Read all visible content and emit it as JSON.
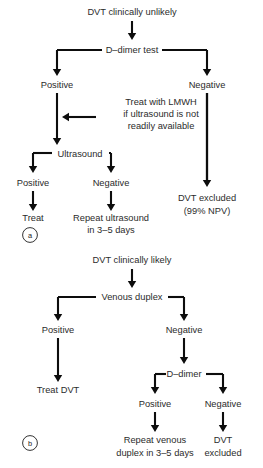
{
  "figure": {
    "width": 263,
    "height": 468,
    "background_color": "#ffffff",
    "line_color": "#0d0d0d",
    "text_color": "#2b2b2b"
  },
  "panels": [
    {
      "id": "a",
      "letter": "a",
      "cx": 30,
      "cy": 235,
      "r": 7.4,
      "title": "DVT clinically unlikely"
    },
    {
      "id": "b",
      "letter": "b",
      "cx": 30,
      "cy": 443,
      "r": 7.4,
      "title": "DVT clinically likely"
    }
  ],
  "nodes": [
    {
      "id": "a-root",
      "text": "DVT clinically unlikely",
      "x": 132,
      "y": 15,
      "anchor": "middle",
      "panel": "a"
    },
    {
      "id": "a-ddimer",
      "text": "D–dimer test",
      "x": 132,
      "y": 53,
      "anchor": "middle",
      "panel": "a"
    },
    {
      "id": "a-pos",
      "text": "Positive",
      "x": 57,
      "y": 88,
      "anchor": "middle",
      "panel": "a"
    },
    {
      "id": "a-neg",
      "text": "Negative",
      "x": 207,
      "y": 88,
      "anchor": "middle",
      "panel": "a"
    },
    {
      "id": "a-lmwh-1",
      "text": "Treat with LMWH",
      "x": 161,
      "y": 105,
      "anchor": "middle",
      "panel": "a"
    },
    {
      "id": "a-lmwh-2",
      "text": "if ultrasound is not",
      "x": 161,
      "y": 117,
      "anchor": "middle",
      "panel": "a"
    },
    {
      "id": "a-lmwh-3",
      "text": "readily available",
      "x": 161,
      "y": 129,
      "anchor": "middle",
      "panel": "a"
    },
    {
      "id": "a-us",
      "text": "Ultrasound",
      "x": 80,
      "y": 157,
      "anchor": "middle",
      "panel": "a"
    },
    {
      "id": "a-us-pos",
      "text": "Positive",
      "x": 33,
      "y": 186,
      "anchor": "middle",
      "panel": "a"
    },
    {
      "id": "a-us-neg",
      "text": "Negative",
      "x": 111,
      "y": 186,
      "anchor": "middle",
      "panel": "a"
    },
    {
      "id": "a-treat",
      "text": "Treat",
      "x": 33,
      "y": 221,
      "anchor": "middle",
      "panel": "a"
    },
    {
      "id": "a-repeat-1",
      "text": "Repeat ultrasound",
      "x": 111,
      "y": 221,
      "anchor": "middle",
      "panel": "a"
    },
    {
      "id": "a-repeat-2",
      "text": "in 3–5 days",
      "x": 111,
      "y": 233,
      "anchor": "middle",
      "panel": "a"
    },
    {
      "id": "a-excluded-1",
      "text": "DVT excluded",
      "x": 207,
      "y": 201,
      "anchor": "middle",
      "panel": "a"
    },
    {
      "id": "a-excluded-2",
      "text": "(99% NPV)",
      "x": 207,
      "y": 214,
      "anchor": "middle",
      "panel": "a"
    },
    {
      "id": "b-root",
      "text": "DVT clinically likely",
      "x": 132,
      "y": 263,
      "anchor": "middle",
      "panel": "b"
    },
    {
      "id": "b-duplex",
      "text": "Venous duplex",
      "x": 132,
      "y": 300,
      "anchor": "middle",
      "panel": "b"
    },
    {
      "id": "b-pos",
      "text": "Positive",
      "x": 58,
      "y": 333,
      "anchor": "middle",
      "panel": "b"
    },
    {
      "id": "b-neg",
      "text": "Negative",
      "x": 184,
      "y": 333,
      "anchor": "middle",
      "panel": "b"
    },
    {
      "id": "b-treat",
      "text": "Treat DVT",
      "x": 58,
      "y": 393,
      "anchor": "middle",
      "panel": "b"
    },
    {
      "id": "b-ddimer",
      "text": "D–dimer",
      "x": 184,
      "y": 377,
      "anchor": "middle",
      "panel": "b"
    },
    {
      "id": "b-dd-pos",
      "text": "Positive",
      "x": 155,
      "y": 407,
      "anchor": "middle",
      "panel": "b"
    },
    {
      "id": "b-dd-neg",
      "text": "Negative",
      "x": 223,
      "y": 407,
      "anchor": "middle",
      "panel": "b"
    },
    {
      "id": "b-repeat-1",
      "text": "Repeat venous",
      "x": 155,
      "y": 443,
      "anchor": "middle",
      "panel": "b"
    },
    {
      "id": "b-repeat-2",
      "text": "duplex in 3–5 days",
      "x": 155,
      "y": 456,
      "anchor": "middle",
      "panel": "b"
    },
    {
      "id": "b-excluded-1",
      "text": "DVT",
      "x": 223,
      "y": 443,
      "anchor": "middle",
      "panel": "b"
    },
    {
      "id": "b-excluded-2",
      "text": "excluded",
      "x": 223,
      "y": 456,
      "anchor": "middle",
      "panel": "b"
    }
  ],
  "connectors": [
    {
      "id": "c-a-root-ddimer",
      "from": "a-root",
      "to": "a-ddimer",
      "path": "M132,21 L132,36",
      "arrow": "down",
      "ax": 132,
      "ay": 40,
      "width": 2.1
    },
    {
      "id": "c-a-dd-left",
      "from": "a-ddimer",
      "to": "a-pos",
      "path": "M57,50 L102,50",
      "arrow": "down",
      "ax": 57,
      "ay": 76,
      "width": 2.1,
      "stem": "M57,50 L57,70"
    },
    {
      "id": "c-a-dd-right",
      "from": "a-ddimer",
      "to": "a-neg",
      "path": "M162,50 L207,50",
      "arrow": "down",
      "ax": 207,
      "ay": 76,
      "width": 2.1,
      "stem": "M207,50 L207,70"
    },
    {
      "id": "c-a-pos-us",
      "from": "a-pos",
      "to": "a-us",
      "path": "M57,93 L57,139",
      "arrow": "down",
      "ax": 57,
      "ay": 145,
      "width": 2.1
    },
    {
      "id": "c-a-lmwh-in",
      "from": "a-lmwh-1",
      "to": "c-a-pos-us",
      "path": "M96,117 L68,117",
      "arrow": "left",
      "ax": 62,
      "ay": 117,
      "width": 2.1
    },
    {
      "id": "c-a-neg-excl",
      "from": "a-neg",
      "to": "a-excluded-1",
      "path": "M207,93 L207,180",
      "arrow": "down",
      "ax": 207,
      "ay": 187,
      "width": 2.3
    },
    {
      "id": "c-a-us-left",
      "from": "a-us",
      "to": "a-us-pos",
      "path": "M33,153 L52,153",
      "arrow": "down",
      "ax": 33,
      "ay": 173,
      "width": 2.1,
      "stem": "M33,153 L33,168"
    },
    {
      "id": "c-a-us-right",
      "from": "a-us",
      "to": "a-us-neg",
      "path": "M111,153 L109,153",
      "arrow": "down",
      "ax": 111,
      "ay": 173,
      "width": 2.1,
      "stem": "M111,153 L111,168"
    },
    {
      "id": "c-a-uspos-treat",
      "from": "a-us-pos",
      "to": "a-treat",
      "path": "M33,191 L33,205",
      "arrow": "down",
      "ax": 33,
      "ay": 211,
      "width": 2.1
    },
    {
      "id": "c-a-usneg-repeat",
      "from": "a-us-neg",
      "to": "a-repeat-1",
      "path": "M111,191 L111,205",
      "arrow": "down",
      "ax": 111,
      "ay": 211,
      "width": 2.1
    },
    {
      "id": "c-b-root-duplex",
      "from": "b-root",
      "to": "b-duplex",
      "path": "M132,269 L132,283",
      "arrow": "down",
      "ax": 132,
      "ay": 288,
      "width": 2.1
    },
    {
      "id": "c-b-dx-left",
      "from": "b-duplex",
      "to": "b-pos",
      "path": "M58,297 L96,297",
      "arrow": "down",
      "ax": 58,
      "ay": 321,
      "width": 2.1,
      "stem": "M58,297 L58,315"
    },
    {
      "id": "c-b-dx-right",
      "from": "b-duplex",
      "to": "b-neg",
      "path": "M168,297 L184,297",
      "arrow": "down",
      "ax": 184,
      "ay": 321,
      "width": 2.1,
      "stem": "M184,297 L184,315"
    },
    {
      "id": "c-b-pos-treat",
      "from": "b-pos",
      "to": "b-treat",
      "path": "M58,338 L58,375",
      "arrow": "down",
      "ax": 58,
      "ay": 382,
      "width": 2.1
    },
    {
      "id": "c-b-neg-ddimer",
      "from": "b-neg",
      "to": "b-ddimer",
      "path": "M184,338 L184,358",
      "arrow": "down",
      "ax": 184,
      "ay": 364,
      "width": 2.1
    },
    {
      "id": "c-b-dd-left",
      "from": "b-ddimer",
      "to": "b-dd-pos",
      "path": "M155,374 L166,374",
      "arrow": "down",
      "ax": 155,
      "ay": 394,
      "width": 2.1,
      "stem": "M155,374 L155,389"
    },
    {
      "id": "c-b-dd-right",
      "from": "b-ddimer",
      "to": "b-dd-neg",
      "path": "M223,374 L206,374",
      "arrow": "down",
      "ax": 223,
      "ay": 394,
      "width": 2.1,
      "stem": "M223,374 L223,389"
    },
    {
      "id": "c-b-pos-repeat",
      "from": "b-dd-pos",
      "to": "b-repeat-1",
      "path": "M155,412 L155,426",
      "arrow": "down",
      "ax": 155,
      "ay": 432,
      "width": 2.1
    },
    {
      "id": "c-b-neg-excl",
      "from": "b-dd-neg",
      "to": "b-excluded-1",
      "path": "M223,412 L223,426",
      "arrow": "down",
      "ax": 223,
      "ay": 432,
      "width": 2.1
    }
  ]
}
